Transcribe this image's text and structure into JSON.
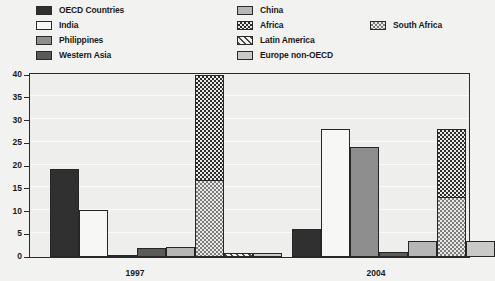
{
  "legend": {
    "left_column": [
      {
        "label": "OECD Countries",
        "swatch": "f-oecd",
        "key": "oecd"
      },
      {
        "label": "India",
        "swatch": "f-india",
        "key": "india"
      },
      {
        "label": "Philippines",
        "swatch": "f-phil",
        "key": "philippines"
      },
      {
        "label": "Western Asia",
        "swatch": "f-wasia",
        "key": "western-asia"
      }
    ],
    "right_column": [
      {
        "label": "China",
        "swatch": "f-china",
        "key": "china"
      },
      {
        "label": "Africa",
        "swatch": "f-africa",
        "key": "africa"
      },
      {
        "label": "Latin America",
        "swatch": "f-latam",
        "key": "latin-america"
      },
      {
        "label": "Europe non-OECD",
        "swatch": "f-europe",
        "key": "europe-non-oecd"
      }
    ],
    "extra": {
      "label": "South Africa",
      "swatch": "f-safrica",
      "key": "south-africa"
    }
  },
  "chart_data": {
    "type": "bar",
    "title": "",
    "subtitle": "",
    "xlabel": "",
    "ylabel": "",
    "ylim": [
      0,
      40
    ],
    "yticks": [
      0,
      5,
      10,
      15,
      20,
      25,
      30,
      35,
      40
    ],
    "ytick_labels": [
      "0",
      "5",
      "10",
      "15",
      "20",
      "25",
      "30",
      "35",
      "40"
    ],
    "grid": true,
    "legend_position": "top",
    "categories": [
      "1997",
      "2004"
    ],
    "series": [
      {
        "name": "OECD Countries",
        "fill": "f-oecd",
        "values": [
          19.2,
          6.0
        ]
      },
      {
        "name": "India",
        "fill": "f-india",
        "values": [
          10.2,
          28.0
        ]
      },
      {
        "name": "Philippines",
        "fill": "f-phil",
        "values": [
          0.3,
          24.0
        ]
      },
      {
        "name": "Western Asia",
        "fill": "f-wasia",
        "values": [
          1.9,
          1.0
        ]
      },
      {
        "name": "China",
        "fill": "f-china",
        "values": [
          2.0,
          3.4
        ]
      },
      {
        "name": "Africa",
        "fill": "f-africa",
        "values": [
          23.2,
          15.0
        ],
        "stacked_on": "South Africa"
      },
      {
        "name": "South Africa",
        "fill": "f-safrica",
        "values": [
          16.8,
          13.0
        ]
      },
      {
        "name": "Latin America",
        "fill": "f-latam",
        "values": [
          0.7,
          0.0
        ]
      },
      {
        "name": "Europe non-OECD",
        "fill": "f-europe",
        "values": [
          0.8,
          3.4
        ]
      }
    ],
    "stack_totals": {
      "Africa+South Africa": [
        40.0,
        28.0
      ]
    }
  },
  "bars_layout": [
    {
      "key": "oecd-1997",
      "name": "OECD Countries",
      "group": "1997",
      "fill": "f-oecd",
      "left": 19,
      "width": 29,
      "value": 19.2
    },
    {
      "key": "india-1997",
      "name": "India",
      "group": "1997",
      "fill": "f-india",
      "left": 48,
      "width": 29,
      "value": 10.2
    },
    {
      "key": "philippines-1997",
      "name": "Philippines",
      "group": "1997",
      "fill": "f-phil",
      "left": 77,
      "width": 29,
      "value": 0.3
    },
    {
      "key": "western-asia-1997",
      "name": "Western Asia",
      "group": "1997",
      "fill": "f-wasia",
      "left": 106,
      "width": 29,
      "value": 1.9
    },
    {
      "key": "china-1997",
      "name": "China",
      "group": "1997",
      "fill": "f-china",
      "left": 135,
      "width": 29,
      "value": 2.0
    },
    {
      "key": "africa-1997",
      "name": "Africa",
      "group": "1997",
      "fill": "f-africa",
      "left": 164,
      "width": 29,
      "value": 40.0,
      "split": 16.8,
      "split_fill": "f-safrica"
    },
    {
      "key": "latin-america-1997",
      "name": "Latin America",
      "group": "1997",
      "fill": "f-latam",
      "left": 193,
      "width": 29,
      "value": 0.7
    },
    {
      "key": "europe-1997",
      "name": "Europe non-OECD",
      "group": "1997",
      "fill": "f-europe",
      "left": 222,
      "width": 29,
      "value": 0.8
    },
    {
      "key": "oecd-2004",
      "name": "OECD Countries",
      "group": "2004",
      "fill": "f-oecd",
      "left": 261,
      "width": 29,
      "value": 6.0
    },
    {
      "key": "india-2004",
      "name": "India",
      "group": "2004",
      "fill": "f-india",
      "left": 290,
      "width": 29,
      "value": 28.0
    },
    {
      "key": "philippines-2004",
      "name": "Philippines",
      "group": "2004",
      "fill": "f-phil",
      "left": 319,
      "width": 29,
      "value": 24.0
    },
    {
      "key": "western-asia-2004",
      "name": "Western Asia",
      "group": "2004",
      "fill": "f-wasia",
      "left": 348,
      "width": 29,
      "value": 1.0
    },
    {
      "key": "china-2004",
      "name": "China",
      "group": "2004",
      "fill": "f-china",
      "left": 377,
      "width": 29,
      "value": 3.4
    },
    {
      "key": "africa-2004",
      "name": "Africa",
      "group": "2004",
      "fill": "f-africa",
      "left": 406,
      "width": 29,
      "value": 28.0,
      "split": 13.0,
      "split_fill": "f-safrica"
    },
    {
      "key": "europe-2004",
      "name": "Europe non-OECD",
      "group": "2004",
      "fill": "f-europe",
      "left": 435,
      "width": 29,
      "value": 3.4
    }
  ],
  "xaxis": {
    "labels": [
      {
        "text": "1997",
        "left": 105
      },
      {
        "text": "2004",
        "left": 346
      }
    ]
  }
}
